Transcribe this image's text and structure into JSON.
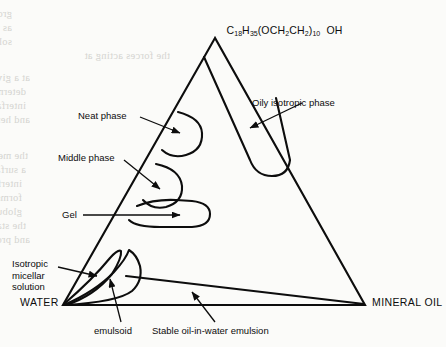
{
  "page": {
    "width": 446,
    "height": 347,
    "background_color": "#fbfbf9",
    "ink_color": "#0d0d0d",
    "showthrough_color": "#cfcfcb"
  },
  "chart_data": {
    "type": "diagram",
    "subtype": "ternary-phase-diagram",
    "title": "",
    "vertices": [
      {
        "name": "surfactant-apex",
        "label": "C18H35(OCH2CH2)10 OH",
        "position": "top",
        "x": 215,
        "y": 38
      },
      {
        "name": "water-vertex",
        "label": "WATER",
        "position": "bottom-left",
        "x": 63,
        "y": 305
      },
      {
        "name": "mineral-oil-vertex",
        "label": "MINERAL OIL",
        "position": "bottom-right",
        "x": 365,
        "y": 305
      }
    ],
    "regions": [
      {
        "name": "neat-phase",
        "label": "Neat phase",
        "shape": "lobe-on-left-edge"
      },
      {
        "name": "middle-phase",
        "label": "Middle phase",
        "shape": "lobe-on-left-edge"
      },
      {
        "name": "gel",
        "label": "Gel",
        "shape": "elongated-horizontal-lobe"
      },
      {
        "name": "oily-isotropic-phase",
        "label": "Oily isotropic phase",
        "shape": "narrow-band-from-apex"
      },
      {
        "name": "isotropic-micellar-solution",
        "label": "Isotropic micellar solution",
        "shape": "narrow-sliver-at-water-vertex"
      },
      {
        "name": "emulsoid",
        "label": "emulsoid",
        "shape": "teardrop-near-water-vertex"
      },
      {
        "name": "stable-oil-in-water-emulsion",
        "label": "Stable oil-in-water emulsion",
        "shape": "thin-wedge-along-base"
      }
    ],
    "axis_ranges": null,
    "grid": false,
    "legend": "none"
  },
  "apex": {
    "formula_parts": [
      {
        "text": "C",
        "sub": false
      },
      {
        "text": "18",
        "sub": true
      },
      {
        "text": "H",
        "sub": false
      },
      {
        "text": "35",
        "sub": true
      },
      {
        "text": "(OCH",
        "sub": false
      },
      {
        "text": "2",
        "sub": true
      },
      {
        "text": "CH",
        "sub": false
      },
      {
        "text": "2",
        "sub": true
      },
      {
        "text": ")",
        "sub": false
      },
      {
        "text": "10",
        "sub": true
      },
      {
        "text": "  OH",
        "sub": false
      }
    ],
    "plain": "C18H35(OCH2CH2)10 OH"
  },
  "labels": {
    "water": "WATER",
    "mineral_oil": "MINERAL OIL",
    "neat_phase": "Neat phase",
    "middle_phase": "Middle phase",
    "gel": "Gel",
    "oily_isotropic_phase": "Oily isotropic phase",
    "isotropic_micellar_solution": "Isotropic\nmicellar\nsolution",
    "emulsoid": "emulsoid",
    "stable_emulsion": "Stable oil-in-water emulsion"
  },
  "showthrough": {
    "lines": [
      {
        "text": "group of the surfactant molecule is immersed in the aqueous phase",
        "x": 12,
        "y": 8
      },
      {
        "text": "as the alkyl chain extends outward from the interfacial layer",
        "x": 12,
        "y": 22
      },
      {
        "text": "soluble in water while insoluble or slightly soluble in the",
        "x": 12,
        "y": 36
      },
      {
        "text": "the forces acting at",
        "x": 170,
        "y": 50
      },
      {
        "text": "at a given interface and the resulting interfacial tension",
        "x": 30,
        "y": 72
      },
      {
        "text": "determine the degree of adsorption of the surfactant at that",
        "x": 26,
        "y": 86
      },
      {
        "text": "interface and the orientation of the molecules in the layer",
        "x": 26,
        "y": 100
      },
      {
        "text": "and hence the properties conferred upon the system",
        "x": 30,
        "y": 114
      },
      {
        "text": "the mechanism by which emulsifying agents produce",
        "x": 28,
        "y": 150
      },
      {
        "text": "a surface active agent concentrates at the oil-water",
        "x": 26,
        "y": 164
      },
      {
        "text": "interface where it reduces the interfacial tension and",
        "x": 22,
        "y": 178
      },
      {
        "text": "forms a coherent interfacial film around the dispersed",
        "x": 22,
        "y": 192
      },
      {
        "text": "globules which prevents the coalescence of the droplets",
        "x": 22,
        "y": 206
      },
      {
        "text": "the stability of the system is determined by the nature",
        "x": 26,
        "y": 220
      },
      {
        "text": "and properties of this interfacial film",
        "x": 30,
        "y": 234
      }
    ]
  }
}
